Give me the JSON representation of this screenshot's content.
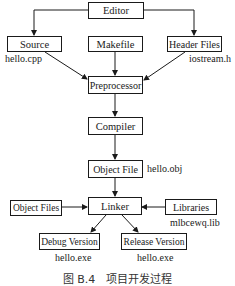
{
  "nodes": {
    "editor": "Editor",
    "source": "Source",
    "makefile": "Makefile",
    "header_files": "Header Files",
    "preprocessor": "Preprocessor",
    "compiler": "Compiler",
    "object_file": "Object File",
    "object_files": "Object Files",
    "linker": "Linker",
    "libraries": "Libraries",
    "debug_version": "Debug Version",
    "release_version": "Release Version"
  },
  "labels": {
    "source_file": "hello.cpp",
    "header_file": "iostream.h",
    "object_file": "hello.obj",
    "library_file": "mlbcewq.lib",
    "debug_exe": "hello.exe",
    "release_exe": "hello.exe"
  },
  "caption": "图 B.4　项目开发过程"
}
